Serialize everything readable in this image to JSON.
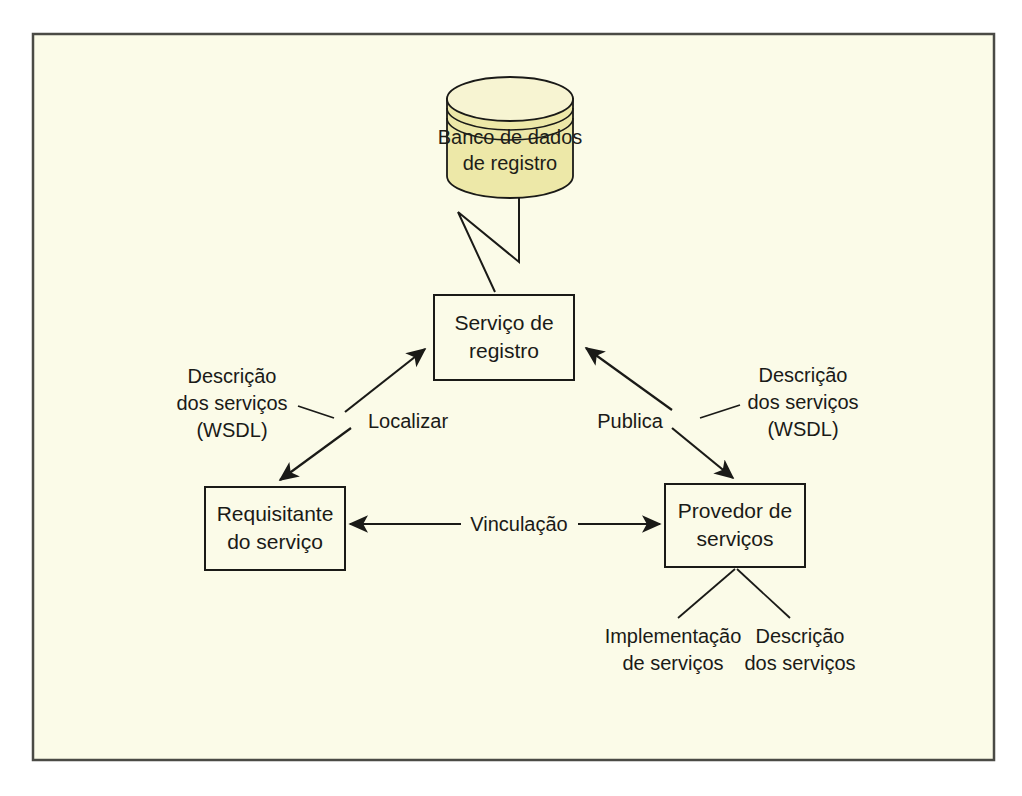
{
  "figure": {
    "frame": {
      "background_color": "#FBFBE8",
      "border_color": "#4a4a45",
      "outside_color": "#ffffff"
    },
    "stroke_color": "#1a1a17"
  },
  "nodes": {
    "database": {
      "name": "registry-database",
      "line1": "Banco de dados",
      "line2": "de registro",
      "body_color": "#EDE8A8",
      "top_color": "#F7F4D2",
      "shape": "cylinder"
    },
    "registry_service": {
      "name": "registry-service",
      "line1": "Serviço de",
      "line2": "registro",
      "fill_color": "#FBFBE8"
    },
    "service_requester": {
      "name": "service-requester",
      "line1": "Requisitante",
      "line2": "do serviço",
      "fill_color": "#FBFBE8"
    },
    "service_provider": {
      "name": "service-provider",
      "line1": "Provedor de",
      "line2": "serviços",
      "fill_color": "#FBFBE8"
    }
  },
  "edges": {
    "locate": {
      "label": "Localizar",
      "from": "service-requester",
      "to": "registry-service",
      "arrow": "double"
    },
    "publish": {
      "label": "Publica",
      "from": "service-provider",
      "to": "registry-service",
      "arrow": "double"
    },
    "binding": {
      "label": "Vinculação",
      "from": "service-requester",
      "to": "service-provider",
      "arrow": "double"
    },
    "db_link": {
      "label": "",
      "from": "registry-database",
      "to": "registry-service",
      "arrow": "none",
      "style": "zigzag"
    }
  },
  "callouts": {
    "left_wsdl": {
      "line1": "Descrição",
      "line2": "dos serviços",
      "line3": "(WSDL)",
      "points_to": "Localizar"
    },
    "right_wsdl": {
      "line1": "Descrição",
      "line2": "dos serviços",
      "line3": "(WSDL)",
      "points_to": "Publica"
    },
    "implementation": {
      "line1": "Implementação",
      "line2": "de serviços",
      "points_to": "service-provider"
    },
    "description": {
      "line1": "Descrição",
      "line2": "dos serviços",
      "points_to": "service-provider"
    }
  }
}
